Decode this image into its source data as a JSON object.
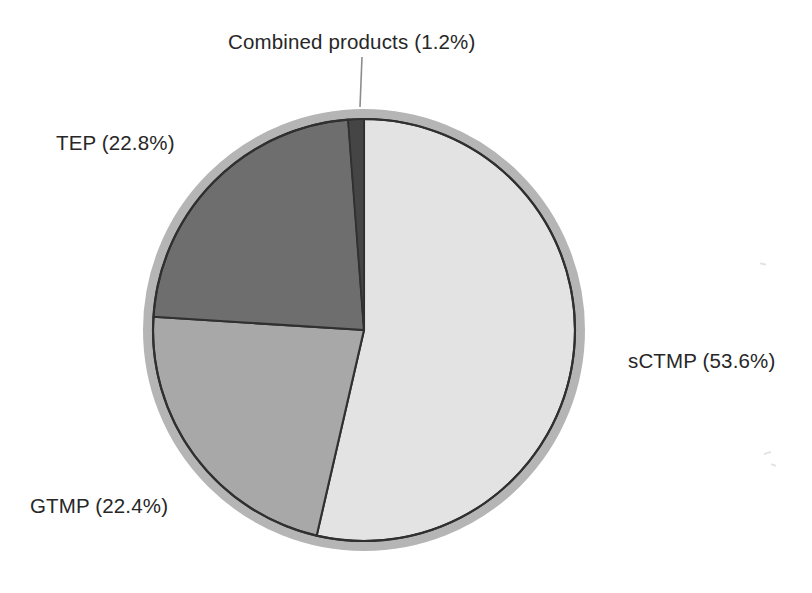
{
  "figure": {
    "background_color": "#ffffff",
    "text_color": "#272727"
  },
  "leader_line": {
    "name": "combined-products-leader-line",
    "color": "#8d8d8d"
  },
  "labels": {
    "combined": "Combined products (1.2%)",
    "tep": "TEP (22.8%)",
    "gtmp": "GTMP (22.4%)",
    "sctmp": "sCTMP (53.6%)"
  },
  "chart_data": {
    "type": "pie",
    "title": "",
    "xlabel": "",
    "ylabel": "",
    "legend_position": "none",
    "grid": false,
    "value_unit": "percent",
    "total": 100.0,
    "start_angle_deg": 0,
    "direction": "clockwise",
    "categories": [
      "sCTMP",
      "GTMP",
      "TEP",
      "Combined products"
    ],
    "values": [
      53.6,
      22.4,
      22.8,
      1.2
    ],
    "labels": [
      "sCTMP (53.6%)",
      "GTMP (22.4%)",
      "TEP (22.8%)",
      "Combined products (1.2%)"
    ],
    "colors": [
      "#e3e3e3",
      "#a8a8a8",
      "#6e6e6e",
      "#454545"
    ],
    "slices": [
      {
        "name": "sCTMP",
        "value": 53.6,
        "label": "sCTMP (53.6%)",
        "color": "#e3e3e3",
        "start_angle_deg": 0,
        "end_angle_deg": 192.96
      },
      {
        "name": "GTMP",
        "value": 22.4,
        "label": "GTMP (22.4%)",
        "color": "#a8a8a8",
        "start_angle_deg": 192.96,
        "end_angle_deg": 273.6
      },
      {
        "name": "TEP",
        "value": 22.8,
        "label": "TEP (22.8%)",
        "color": "#6e6e6e",
        "start_angle_deg": 273.6,
        "end_angle_deg": 355.68
      },
      {
        "name": "Combined products",
        "value": 1.2,
        "label": "Combined products (1.2%)",
        "color": "#454545",
        "start_angle_deg": 355.68,
        "end_angle_deg": 360
      }
    ],
    "style": {
      "outer_ring_color": "#b5b5b5",
      "outline_color": "#303030",
      "center_x": 364,
      "center_y": 330,
      "radius": 211,
      "ring_radius": 218
    }
  }
}
